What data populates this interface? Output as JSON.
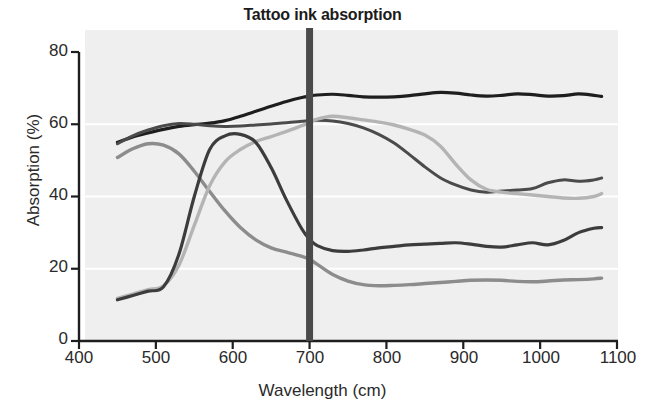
{
  "chart_data": {
    "type": "line",
    "title": "Tattoo ink absorption",
    "xlabel": "Wavelength (cm)",
    "ylabel": "Absorption (%)",
    "xlim": [
      400,
      1100
    ],
    "ylim": [
      0,
      80
    ],
    "xticks": [
      400,
      500,
      600,
      700,
      800,
      900,
      1000,
      1100
    ],
    "yticks": [
      0,
      20,
      40,
      60,
      80
    ],
    "grid": "horizontal-white-gridlines",
    "legend": "none",
    "plot_background": "#efefef",
    "annotations": [
      {
        "name": "ruby-marker",
        "label": "Ruby",
        "type": "vertical-line",
        "x": 700,
        "color": "#4a4a4a",
        "label_position": "left-of-line-near-bottom"
      }
    ],
    "x": [
      450,
      470,
      490,
      510,
      530,
      550,
      570,
      590,
      610,
      630,
      650,
      670,
      690,
      700,
      710,
      730,
      750,
      770,
      790,
      810,
      830,
      850,
      870,
      890,
      910,
      930,
      950,
      970,
      990,
      1010,
      1030,
      1050,
      1070,
      1080
    ],
    "series": [
      {
        "name": "black-curve",
        "color": "#1e1e1e",
        "width": 3.2,
        "style": "solid",
        "values": [
          55,
          56.5,
          57.6,
          58.6,
          59.4,
          59.9,
          60.3,
          61.0,
          62.2,
          63.6,
          65.0,
          66.3,
          67.4,
          67.8,
          68.1,
          68.3,
          68.0,
          67.6,
          67.5,
          67.6,
          67.9,
          68.4,
          68.8,
          68.6,
          68.1,
          67.8,
          68.0,
          68.4,
          68.2,
          67.8,
          67.9,
          68.4,
          68.0,
          67.7
        ]
      },
      {
        "name": "dark-gray-curve",
        "color": "#4b4b4b",
        "width": 3.0,
        "style": "solid",
        "values": [
          54.6,
          56.8,
          58.4,
          59.6,
          60.2,
          60.0,
          59.6,
          59.4,
          59.5,
          59.8,
          60.1,
          60.4,
          60.8,
          61.0,
          61.1,
          60.9,
          60.2,
          59.0,
          57.2,
          54.8,
          51.6,
          48.2,
          45.2,
          43.2,
          41.8,
          41.2,
          41.5,
          41.8,
          42.2,
          43.8,
          44.6,
          44.2,
          44.6,
          45.1
        ]
      },
      {
        "name": "medium-gray-curve",
        "color": "#8c8c8c",
        "width": 3.4,
        "style": "solid",
        "values": [
          50.8,
          53.2,
          54.6,
          54.2,
          51.8,
          47.0,
          41.4,
          36.0,
          31.4,
          28.0,
          25.8,
          24.6,
          23.4,
          22.6,
          21.2,
          18.4,
          16.6,
          15.6,
          15.3,
          15.4,
          15.6,
          15.9,
          16.2,
          16.5,
          16.8,
          16.9,
          16.8,
          16.5,
          16.4,
          16.6,
          16.9,
          17.0,
          17.2,
          17.4
        ]
      },
      {
        "name": "light-gray-curve",
        "color": "#b4b4b4",
        "width": 3.4,
        "style": "solid",
        "values": [
          11.8,
          13.0,
          14.2,
          15.3,
          21.0,
          32.0,
          43.0,
          49.6,
          53.0,
          55.2,
          56.6,
          58.0,
          59.6,
          60.4,
          61.4,
          62.2,
          61.8,
          61.2,
          60.6,
          59.8,
          58.6,
          57.0,
          54.0,
          49.0,
          44.6,
          42.0,
          41.2,
          40.8,
          40.4,
          40.0,
          39.6,
          39.5,
          40.0,
          40.8
        ]
      },
      {
        "name": "mid-dark-curve",
        "color": "#3c3c3c",
        "width": 3.2,
        "style": "solid",
        "values": [
          11.4,
          12.6,
          13.8,
          15.0,
          24.0,
          40.0,
          53.0,
          56.8,
          57.2,
          55.0,
          48.0,
          39.0,
          31.0,
          28.2,
          26.4,
          25.0,
          24.8,
          25.2,
          25.8,
          26.2,
          26.6,
          26.8,
          27.0,
          27.2,
          26.8,
          26.2,
          26.0,
          26.6,
          27.2,
          26.6,
          27.8,
          30.0,
          31.2,
          31.4
        ]
      }
    ]
  },
  "axes": {
    "ytick_labels": [
      "80",
      "60",
      "40",
      "20",
      "0"
    ],
    "xtick_labels": [
      "400",
      "500",
      "600",
      "700",
      "800",
      "900",
      "1000",
      "1100"
    ]
  }
}
